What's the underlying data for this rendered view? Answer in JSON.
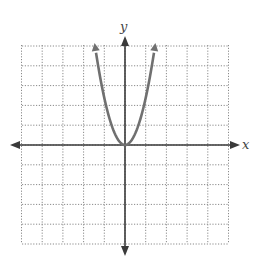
{
  "chart_data": {
    "type": "line",
    "title": "",
    "xlabel": "x",
    "ylabel": "y",
    "xlim": [
      -5,
      5
    ],
    "ylim": [
      -5,
      5
    ],
    "grid": true,
    "grid_style": "dotted",
    "series": [
      {
        "name": "parabola",
        "equation": "y = a x^2 (a ≈ 2.4)",
        "vertex": [
          0,
          0
        ],
        "x": [
          -1.45,
          -1.2,
          -1.0,
          -0.8,
          -0.6,
          -0.4,
          -0.2,
          0,
          0.2,
          0.4,
          0.6,
          0.8,
          1.0,
          1.2,
          1.45
        ],
        "values": [
          5.0,
          3.46,
          2.4,
          1.54,
          0.86,
          0.38,
          0.1,
          0,
          0.1,
          0.38,
          0.86,
          1.54,
          2.4,
          3.46,
          5.0
        ],
        "color": "#707070",
        "arrows_on_ends": true
      }
    ]
  },
  "labels": {
    "x_axis": "x",
    "y_axis": "y"
  },
  "colors": {
    "grid": "#8a8a8a",
    "axis": "#3a3a3a",
    "curve": "#707070"
  }
}
